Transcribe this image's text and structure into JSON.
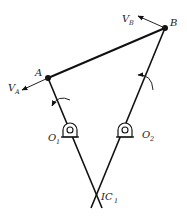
{
  "diagram": {
    "title": "",
    "points": {
      "A": {
        "label": "A",
        "x": 48,
        "y": 78
      },
      "B": {
        "label": "B",
        "x": 165,
        "y": 28
      },
      "O1": {
        "label": "O",
        "sub": "1",
        "x": 70,
        "y": 131
      },
      "O2": {
        "label": "O",
        "sub": "2",
        "x": 125,
        "y": 131
      },
      "IC1": {
        "label": "IC",
        "sub": "1",
        "x": 97,
        "y": 196
      }
    },
    "vectors": {
      "VA": {
        "label": "V",
        "sub": "A"
      },
      "VB": {
        "label": "V",
        "sub": "B"
      }
    },
    "colors": {
      "line": "#111111",
      "background": "#ffffff"
    }
  }
}
